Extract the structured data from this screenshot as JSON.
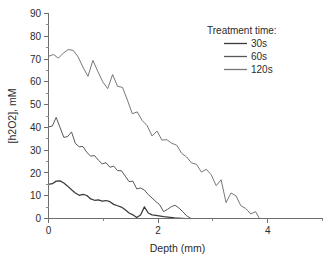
{
  "chart_data": {
    "type": "line",
    "title": "",
    "xlabel": "Depth (mm)",
    "ylabel": "[h2O2], mM",
    "xlim": [
      0,
      5
    ],
    "ylim": [
      0,
      90
    ],
    "xticks": [
      0,
      2,
      4
    ],
    "xticks_minor": [
      1,
      3,
      5
    ],
    "yticks": [
      0,
      10,
      20,
      30,
      40,
      50,
      60,
      70,
      80,
      90
    ],
    "grid": false,
    "legend_position": "top-right",
    "legend_title": "Treatment time:",
    "series": [
      {
        "name": "30s",
        "color": "#3a3a3a",
        "x": [
          0.0,
          0.07,
          0.14,
          0.21,
          0.28,
          0.35,
          0.42,
          0.49,
          0.56,
          0.63,
          0.7,
          0.77,
          0.84,
          0.91,
          0.98,
          1.05,
          1.12,
          1.19,
          1.26,
          1.33,
          1.4,
          1.47,
          1.54,
          1.61,
          1.68,
          1.75,
          1.82,
          1.89,
          1.96,
          2.1,
          2.3,
          2.5
        ],
        "y": [
          15.0,
          15.3,
          16.4,
          16.5,
          15.6,
          14.2,
          12.6,
          11.2,
          10.2,
          10.6,
          10.1,
          8.6,
          8.0,
          8.2,
          7.6,
          7.9,
          7.4,
          6.2,
          5.6,
          5.0,
          3.8,
          2.4,
          1.6,
          0.4,
          1.5,
          5.1,
          2.4,
          1.6,
          1.4,
          0.8,
          0.3,
          0.0
        ]
      },
      {
        "name": "60s",
        "color": "#585858",
        "x": [
          0.0,
          0.07,
          0.14,
          0.21,
          0.28,
          0.35,
          0.42,
          0.49,
          0.56,
          0.63,
          0.7,
          0.77,
          0.84,
          0.91,
          0.98,
          1.05,
          1.12,
          1.19,
          1.26,
          1.33,
          1.4,
          1.47,
          1.54,
          1.61,
          1.68,
          1.75,
          1.82,
          1.89,
          1.96,
          2.03,
          2.1,
          2.17,
          2.24,
          2.31,
          2.38,
          2.45,
          2.52,
          2.6
        ],
        "y": [
          40.2,
          40.6,
          44.4,
          40.0,
          35.6,
          36.0,
          38.0,
          33.0,
          31.5,
          31.6,
          29.0,
          27.4,
          27.6,
          25.6,
          24.0,
          24.5,
          22.5,
          23.0,
          21.0,
          21.0,
          18.6,
          16.2,
          16.4,
          13.0,
          13.4,
          12.5,
          10.5,
          9.0,
          7.4,
          6.0,
          3.0,
          4.0,
          5.2,
          5.8,
          4.6,
          3.0,
          1.2,
          0.0
        ]
      },
      {
        "name": "120s",
        "color": "#777777",
        "x": [
          0.0,
          0.09,
          0.18,
          0.27,
          0.36,
          0.45,
          0.54,
          0.63,
          0.72,
          0.81,
          0.9,
          0.99,
          1.08,
          1.17,
          1.26,
          1.35,
          1.44,
          1.53,
          1.62,
          1.71,
          1.8,
          1.89,
          1.98,
          2.07,
          2.16,
          2.25,
          2.34,
          2.43,
          2.52,
          2.61,
          2.7,
          2.79,
          2.88,
          2.97,
          3.06,
          3.15,
          3.24,
          3.33,
          3.42,
          3.51,
          3.6,
          3.69,
          3.78,
          3.85
        ],
        "y": [
          71.2,
          72.0,
          70.4,
          72.6,
          74.2,
          73.8,
          71.0,
          66.4,
          62.4,
          69.4,
          64.6,
          60.0,
          57.0,
          63.2,
          58.0,
          57.6,
          52.0,
          46.0,
          46.8,
          43.0,
          40.8,
          36.2,
          38.4,
          34.4,
          34.6,
          33.0,
          32.2,
          28.6,
          27.0,
          24.4,
          23.8,
          20.4,
          21.6,
          19.2,
          14.4,
          17.0,
          7.0,
          11.2,
          10.0,
          5.6,
          4.4,
          2.0,
          3.0,
          0.0
        ]
      }
    ]
  }
}
